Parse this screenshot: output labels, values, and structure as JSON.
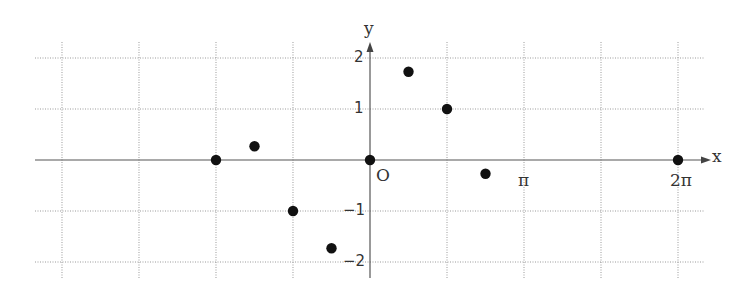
{
  "chart_data": {
    "type": "scatter",
    "title": "",
    "xlabel": "x",
    "ylabel": "y",
    "origin_label": "O",
    "x_tick_labels": [
      {
        "value": 3.14159,
        "label": "π"
      },
      {
        "value": 6.28319,
        "label": "2π"
      }
    ],
    "y_tick_labels": [
      {
        "value": 2,
        "label": "2"
      },
      {
        "value": 1,
        "label": "1"
      },
      {
        "value": -1,
        "label": "−1"
      },
      {
        "value": -2,
        "label": "−2"
      }
    ],
    "grid": true,
    "grid_style": "dotted",
    "x_grid_step": 0.7854,
    "y_grid_step": 1,
    "xlim": [
      -4.3,
      6.9
    ],
    "ylim": [
      -2.3,
      2.3
    ],
    "legend": null,
    "points": [
      {
        "x": -1.5708,
        "y": 0.0
      },
      {
        "x": -1.1781,
        "y": 0.27
      },
      {
        "x": -0.7854,
        "y": -1.0
      },
      {
        "x": -0.3927,
        "y": -1.73
      },
      {
        "x": 0.0,
        "y": 0.0
      },
      {
        "x": 0.3927,
        "y": 1.73
      },
      {
        "x": 0.7854,
        "y": 1.0
      },
      {
        "x": 1.1781,
        "y": -0.27
      },
      {
        "x": 3.1416,
        "y": 0.0
      }
    ],
    "colors": {
      "points": "#111111",
      "axes": "#555555",
      "grid": "#9a9a9a"
    }
  }
}
